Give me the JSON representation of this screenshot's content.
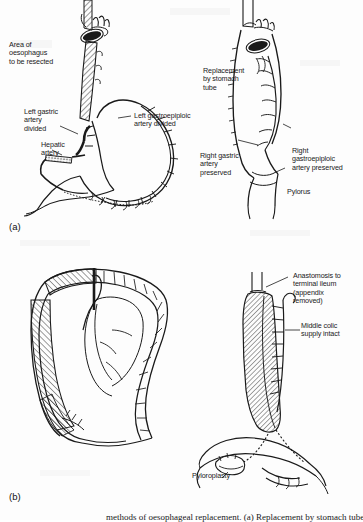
{
  "figure": {
    "background_color": "#fdfdfd",
    "ink_color": "#1a1a1a"
  },
  "panels": [
    {
      "id": "(a)",
      "name": "stomach-tube-replacement",
      "labels": [
        {
          "name": "label-area-of-oesophagus",
          "text": "Area of\noesophagus\nto be resected"
        },
        {
          "name": "label-left-gastric-artery-divided",
          "text": "Left gastric\nartery\ndivided"
        },
        {
          "name": "label-hepatic-artery",
          "text": "Hepatic\nartery"
        },
        {
          "name": "label-left-gastroepiploic-artery-divided",
          "text": "Left gastroepiploic\nartery divided"
        },
        {
          "name": "label-replacement-by-stomach-tube",
          "text": "Replacement\nby stomach\ntube"
        },
        {
          "name": "label-right-gastric-artery-preserved",
          "text": "Right gastric\nartery\npreserved"
        },
        {
          "name": "label-right-gastroepiploic-artery-preserved",
          "text": "Right\ngastroepiploic\nartery preserved"
        },
        {
          "name": "label-pylorus",
          "text": "Pylorus"
        }
      ]
    },
    {
      "id": "(b)",
      "name": "colon-interposition",
      "labels": [
        {
          "name": "label-anastomosis-terminal-ileum",
          "text": "Anastomosis to\nterminal ileum\n(appendix\nremoved)"
        },
        {
          "name": "label-middle-colic-supply-intact",
          "text": "Middle colic\nsupply intact"
        },
        {
          "name": "label-pyloroplasty",
          "text": "Pyloroplasty"
        }
      ]
    }
  ],
  "caption": {
    "name": "figure-caption",
    "text": "methods of oesophageal replacement. (a) Replacement by stomach tube."
  }
}
